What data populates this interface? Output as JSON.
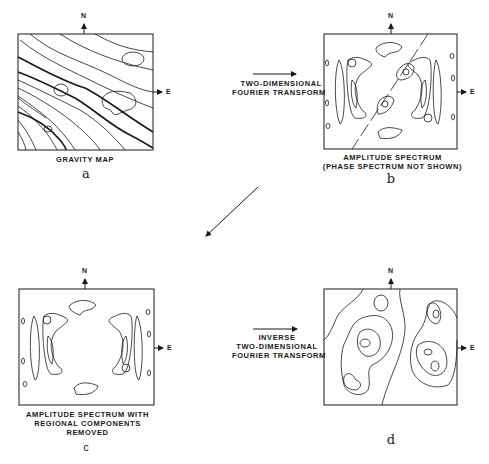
{
  "panels": {
    "a": {
      "letter": "a",
      "caption": [
        "GRAVITY MAP"
      ]
    },
    "b": {
      "letter": "b",
      "caption": [
        "AMPLITUDE SPECTRUM",
        "(PHASE SPECTRUM NOT SHOWN)"
      ]
    },
    "c": {
      "letter": "c",
      "caption": [
        "AMPLITUDE SPECTRUM WITH",
        "REGIONAL COMPONENTS",
        "REMOVED"
      ]
    },
    "d": {
      "letter": "d",
      "caption": []
    }
  },
  "transforms": {
    "forward": [
      "TWO-DIMENSIONAL",
      "FOURIER TRANSFORM"
    ],
    "inverse": [
      "INVERSE",
      "TWO-DIMENSIONAL",
      "FOURIER TRANSFORM"
    ]
  },
  "compass": {
    "north": "N",
    "east": "E"
  },
  "colors": {
    "ink": "#1a1a1a",
    "background": "#ffffff"
  }
}
